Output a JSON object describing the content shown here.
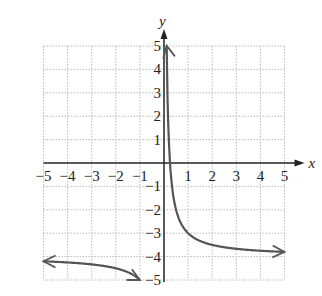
{
  "chart_data": {
    "type": "line",
    "title": "",
    "xlabel": "x",
    "ylabel": "y",
    "xlim": [
      -5,
      5
    ],
    "ylim": [
      -5,
      5
    ],
    "grid": true,
    "legend": null,
    "x_ticks": [
      "-5",
      "-4",
      "-3",
      "-2",
      "-1",
      "1",
      "2",
      "3",
      "4",
      "5"
    ],
    "y_ticks": [
      "5",
      "4",
      "3",
      "2",
      "1",
      "-1",
      "-2",
      "-3",
      "-4",
      "-5"
    ],
    "function": "y = 1/x - 4",
    "asymptotes": {
      "vertical": "x = 0",
      "horizontal": "y = -4"
    },
    "series": [
      {
        "name": "right branch",
        "x": [
          0.2,
          0.25,
          0.33,
          0.5,
          1,
          2,
          3,
          4,
          5
        ],
        "y": [
          1,
          0,
          -1,
          -2,
          -3,
          -3.5,
          -3.67,
          -3.75,
          -3.8
        ]
      },
      {
        "name": "left branch",
        "x": [
          -5,
          -4,
          -3,
          -2,
          -1
        ],
        "y": [
          -4.2,
          -4.25,
          -4.33,
          -4.5,
          -5
        ]
      }
    ],
    "colors": {
      "curve": "#555555",
      "axes": "#222222",
      "grid": "#bbbbbb"
    }
  }
}
